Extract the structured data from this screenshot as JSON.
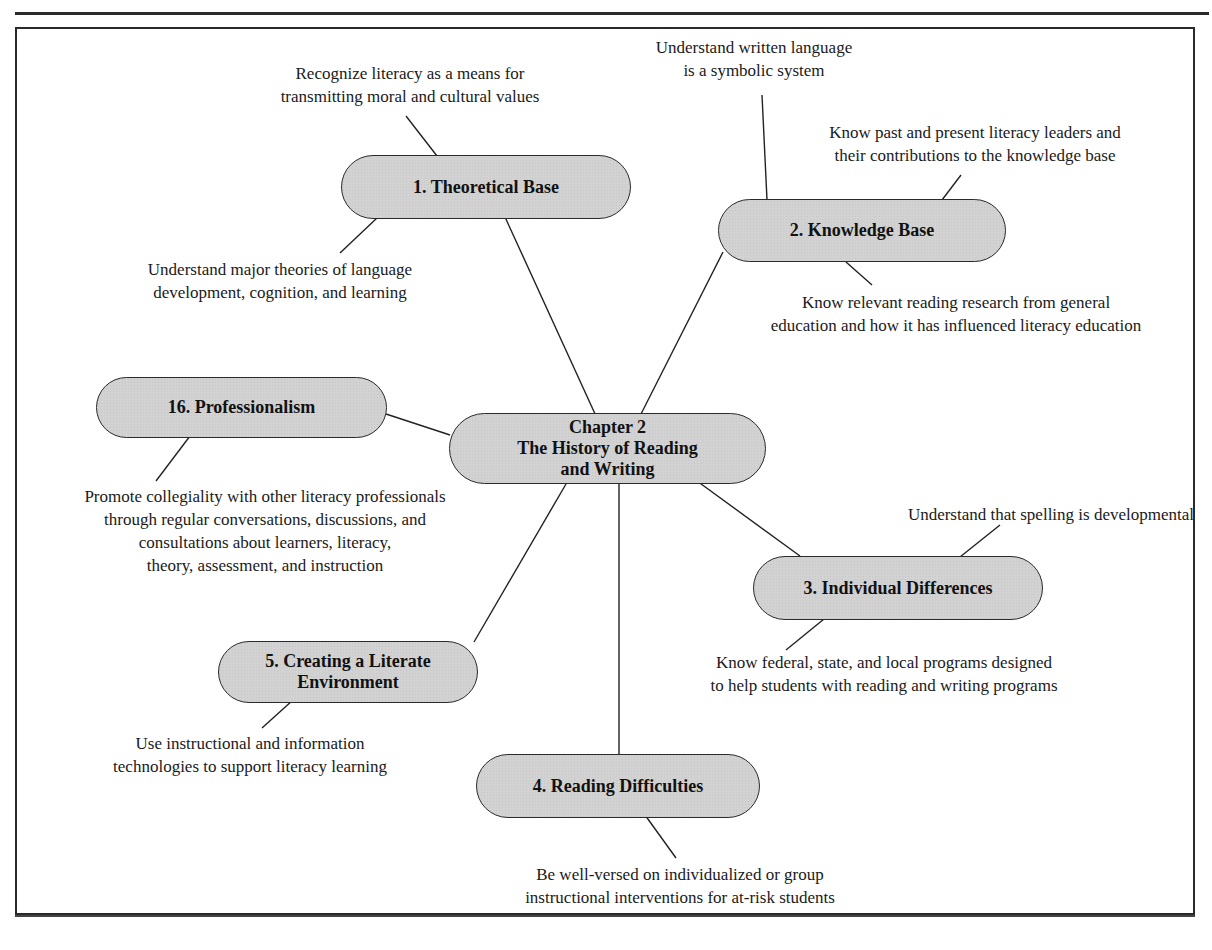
{
  "diagram": {
    "type": "concept-map",
    "center": {
      "id": "center",
      "label": "Chapter 2\nThe History of Reading\nand Writing"
    },
    "branches": [
      {
        "id": "theoretical-base",
        "label": "1. Theoretical Base",
        "leaves": [
          "Recognize literacy as a means for\ntransmitting moral and cultural values",
          "Understand major theories of language\ndevelopment, cognition, and learning"
        ]
      },
      {
        "id": "knowledge-base",
        "label": "2. Knowledge Base",
        "leaves": [
          "Understand written language\nis a symbolic system",
          "Know past and present literacy leaders and\ntheir contributions to the knowledge base",
          "Know relevant reading research from general\neducation and how it has influenced literacy education"
        ]
      },
      {
        "id": "individual-differences",
        "label": "3. Individual Differences",
        "leaves": [
          "Understand that spelling is developmental",
          "Know federal, state, and local programs designed\nto help students with reading and writing programs"
        ]
      },
      {
        "id": "reading-difficulties",
        "label": "4. Reading Difficulties",
        "leaves": [
          "Be well-versed on individualized or group\ninstructional interventions for at-risk students"
        ]
      },
      {
        "id": "literate-environment",
        "label": "5. Creating a Literate\nEnvironment",
        "leaves": [
          "Use instructional and information\ntechnologies to support literacy learning"
        ]
      },
      {
        "id": "professionalism",
        "label": "16. Professionalism",
        "leaves": [
          "Promote collegiality with other literacy professionals\nthrough regular conversations, discussions, and\nconsultations about learners, literacy,\ntheory, assessment, and instruction"
        ]
      }
    ]
  },
  "colors": {
    "node_fill": "#d2d2d2",
    "stroke": "#222222",
    "background": "#ffffff"
  }
}
